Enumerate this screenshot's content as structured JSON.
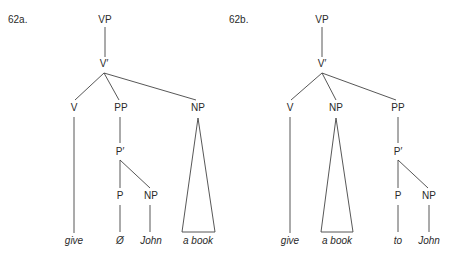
{
  "trees": [
    {
      "id": "62a",
      "label": "62a.",
      "nodes": {
        "vp": "VP",
        "vbar": "V′",
        "v": "V",
        "pp": "PP",
        "np": "NP",
        "pbar": "P′",
        "p": "P",
        "np2": "NP"
      },
      "leaves": {
        "give": "give",
        "p": "Ø",
        "john": "John",
        "np": "a book"
      }
    },
    {
      "id": "62b",
      "label": "62b.",
      "nodes": {
        "vp": "VP",
        "vbar": "V′",
        "v": "V",
        "np": "NP",
        "pp": "PP",
        "pbar": "P′",
        "p": "P",
        "np2": "NP"
      },
      "leaves": {
        "give": "give",
        "np": "a book",
        "p": "to",
        "john": "John"
      }
    }
  ],
  "colors": {
    "line": "#444444",
    "text": "#2a2a2a",
    "background": "#ffffff"
  }
}
